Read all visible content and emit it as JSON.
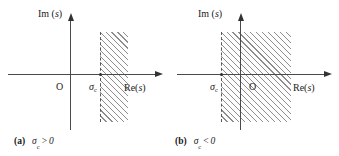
{
  "figure": {
    "type": "s-plane region of convergence diagram",
    "panels": [
      {
        "id": "a",
        "caption_tag": "(a)",
        "caption_symbol": "σ",
        "caption_sub": "c",
        "caption_operator": ">",
        "caption_value": "0",
        "axis_imag_label_prefix": "Im (",
        "axis_imag_label_var": "s",
        "axis_imag_label_suffix": ")",
        "axis_real_label_prefix": "Re(",
        "axis_real_label_var": "s",
        "axis_real_label_suffix": ")",
        "origin_label": "O",
        "sigma_symbol": "σ",
        "sigma_sub": "c",
        "region_description": "right half plane to the right of sigma_c, hatched",
        "boundary_style": "dashed"
      },
      {
        "id": "b",
        "caption_tag": "(b)",
        "caption_symbol": "σ",
        "caption_sub": "c",
        "caption_operator": "<",
        "caption_value": "0",
        "axis_imag_label_prefix": "Im (",
        "axis_imag_label_var": "s",
        "axis_imag_label_suffix": ")",
        "axis_real_label_prefix": "Re(",
        "axis_real_label_var": "s",
        "axis_real_label_suffix": ")",
        "origin_label": "O",
        "sigma_symbol": "σ",
        "sigma_sub": "c",
        "region_description": "right half plane to the right of sigma_c, hatched, sigma_c left of origin",
        "boundary_style": "dashed"
      }
    ],
    "colors": {
      "axis": "#4a4a4a",
      "hatch": "#8d8d8d",
      "boundary": "#5a5a5a",
      "text": "#1a1a1a",
      "background": "#ffffff"
    }
  }
}
